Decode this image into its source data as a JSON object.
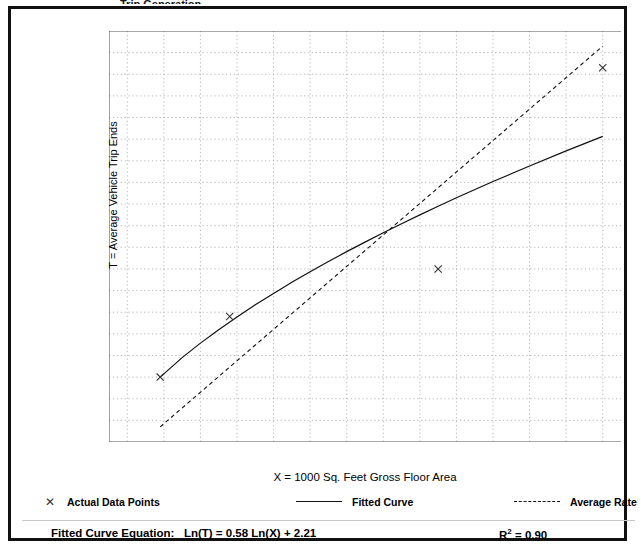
{
  "figure": {
    "clipped_top_text": "Trip Generation"
  },
  "chart_data": {
    "type": "scatter",
    "title": "",
    "xlabel": "X = 1000 Sq. Feet Gross Floor Area",
    "ylabel": "T = Average Vehicle Trip Ends",
    "xlim": [
      5,
      145
    ],
    "ylim": [
      20,
      210
    ],
    "xticks": [
      10,
      20,
      30,
      40,
      50,
      60,
      70,
      80,
      90,
      100,
      110,
      120,
      130,
      140
    ],
    "yticks": [
      20,
      30,
      40,
      50,
      60,
      70,
      80,
      90,
      100,
      110,
      120,
      130,
      140,
      150,
      160,
      170,
      180,
      190,
      200,
      210
    ],
    "grid": true,
    "grid_style": "dotted",
    "legend_position": "below",
    "series": [
      {
        "name": "Actual Data Points",
        "type": "scatter",
        "marker": "x",
        "points": [
          {
            "x": 19,
            "y": 50
          },
          {
            "x": 38,
            "y": 78
          },
          {
            "x": 95,
            "y": 100
          },
          {
            "x": 140,
            "y": 193
          }
        ]
      },
      {
        "name": "Fitted Curve",
        "type": "line",
        "style": "solid",
        "equation": "Ln(T) = 0.58 Ln(X) + 2.21",
        "points": [
          {
            "x": 19,
            "y": 50.0
          },
          {
            "x": 25,
            "y": 59.0
          },
          {
            "x": 30,
            "y": 65.7
          },
          {
            "x": 35,
            "y": 71.9
          },
          {
            "x": 40,
            "y": 77.8
          },
          {
            "x": 45,
            "y": 83.4
          },
          {
            "x": 50,
            "y": 88.7
          },
          {
            "x": 55,
            "y": 93.8
          },
          {
            "x": 60,
            "y": 98.7
          },
          {
            "x": 65,
            "y": 103.4
          },
          {
            "x": 70,
            "y": 108.0
          },
          {
            "x": 75,
            "y": 112.4
          },
          {
            "x": 80,
            "y": 116.7
          },
          {
            "x": 85,
            "y": 120.9
          },
          {
            "x": 90,
            "y": 125.0
          },
          {
            "x": 95,
            "y": 129.0
          },
          {
            "x": 100,
            "y": 132.9
          },
          {
            "x": 110,
            "y": 140.4
          },
          {
            "x": 120,
            "y": 147.6
          },
          {
            "x": 130,
            "y": 154.6
          },
          {
            "x": 140,
            "y": 161.3
          }
        ]
      },
      {
        "name": "Average Rate",
        "type": "line",
        "style": "dashed",
        "points": [
          {
            "x": 19,
            "y": 27.0
          },
          {
            "x": 140,
            "y": 203.0
          }
        ]
      }
    ],
    "legend": [
      {
        "label": "Actual Data Points",
        "marker": "x"
      },
      {
        "label": "Fitted Curve",
        "marker": "solid-line"
      },
      {
        "label": "Average Rate",
        "marker": "dashed-line"
      }
    ],
    "annotations": {
      "equation_label": "Fitted Curve Equation:",
      "equation_value": "Ln(T) = 0.58 Ln(X) + 2.21",
      "r_squared_label": "R",
      "r_squared_exponent": "2",
      "r_squared_value": "= 0.90"
    },
    "colors": {
      "axis": "#555555",
      "grid": "#aaaaaa",
      "fitted_curve": "#111111",
      "average_rate": "#111111",
      "marker": "#333333",
      "frame": "#111111"
    }
  }
}
